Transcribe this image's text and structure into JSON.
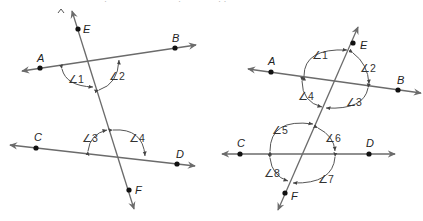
{
  "figures": [
    {
      "id": "left",
      "description": "Two lines AB and CD cut by transversal EF; angles 1,2 at intersection with AB, angles 3,4 at intersection with CD",
      "points": {
        "A": {
          "label": "A",
          "x": 40,
          "y": 68
        },
        "B": {
          "label": "B",
          "x": 175,
          "y": 48
        },
        "C": {
          "label": "C",
          "x": 36,
          "y": 148
        },
        "D": {
          "label": "D",
          "x": 177,
          "y": 164
        },
        "E": {
          "label": "E",
          "x": 78,
          "y": 29
        },
        "F": {
          "label": "F",
          "x": 129,
          "y": 190
        }
      },
      "angles": [
        {
          "label": "∠1"
        },
        {
          "label": "∠2"
        },
        {
          "label": "∠3"
        },
        {
          "label": "∠4"
        }
      ]
    },
    {
      "id": "right",
      "description": "Two lines AB and CD cut by transversal EF; angles 1-4 around upper intersection, angles 5-8 around lower intersection",
      "points": {
        "A": {
          "label": "A",
          "x": 271,
          "y": 72
        },
        "B": {
          "label": "B",
          "x": 398,
          "y": 90
        },
        "C": {
          "label": "C",
          "x": 240,
          "y": 154
        },
        "D": {
          "label": "D",
          "x": 369,
          "y": 154
        },
        "E": {
          "label": "E",
          "x": 353,
          "y": 43
        },
        "F": {
          "label": "F",
          "x": 285,
          "y": 193
        }
      },
      "angles": [
        {
          "label": "∠1"
        },
        {
          "label": "∠2"
        },
        {
          "label": "∠3"
        },
        {
          "label": "∠4"
        },
        {
          "label": "∠5"
        },
        {
          "label": "∠6"
        },
        {
          "label": "∠7"
        },
        {
          "label": "∠8"
        }
      ]
    }
  ],
  "colors": {
    "line": "#6b6b6b",
    "point": "#111111",
    "text": "#222222",
    "background": "#ffffff"
  }
}
